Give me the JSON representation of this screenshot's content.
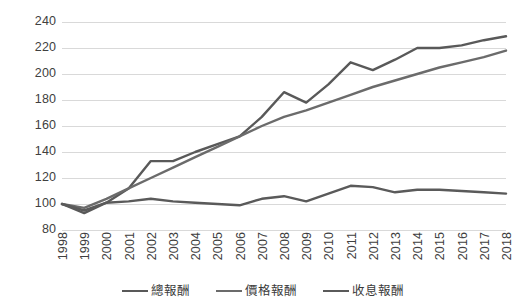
{
  "chart_data": {
    "type": "line",
    "title": "",
    "subtitle": "",
    "xlabel": "",
    "ylabel": "",
    "xlim": [
      1998,
      2018
    ],
    "ylim": [
      80,
      240
    ],
    "ytick_step": 20,
    "grid": true,
    "grid_axis": "y",
    "legend_position": "bottom",
    "categories": [
      "1998",
      "1999",
      "2000",
      "2001",
      "2002",
      "2003",
      "2004",
      "2005",
      "2006",
      "2007",
      "2008",
      "2009",
      "2010",
      "2011",
      "2012",
      "2013",
      "2014",
      "2015",
      "2016",
      "2017",
      "2018"
    ],
    "yticks": [
      80,
      100,
      120,
      140,
      160,
      180,
      200,
      220,
      240
    ],
    "ytick_labels": [
      "80",
      "100",
      "120",
      "140",
      "160",
      "180",
      "200",
      "220",
      "240"
    ],
    "series": [
      {
        "name": "總報酬",
        "color": "#595959",
        "width": 2.4,
        "values": [
          100,
          93,
          101,
          112,
          133,
          133,
          140,
          146,
          152,
          167,
          186,
          178,
          192,
          209,
          203,
          211,
          220,
          220,
          222,
          226,
          229
        ]
      },
      {
        "name": "價格報酬",
        "color": "#6b6b6b",
        "width": 2.4,
        "values": [
          100,
          97,
          104,
          112,
          120,
          128,
          136,
          144,
          152,
          160,
          167,
          172,
          178,
          184,
          190,
          195,
          200,
          205,
          209,
          213,
          218
        ]
      },
      {
        "name": "收息報酬",
        "color": "#5a5a5a",
        "width": 2.4,
        "values": [
          100,
          95,
          101,
          102,
          104,
          102,
          101,
          100,
          99,
          104,
          106,
          102,
          108,
          114,
          113,
          109,
          111,
          111,
          110,
          109,
          108
        ]
      }
    ],
    "legend": [
      {
        "label": "總報酬",
        "color": "#595959"
      },
      {
        "label": "價格報酬",
        "color": "#6b6b6b"
      },
      {
        "label": "收息報酬",
        "color": "#5a5a5a"
      }
    ],
    "style": {
      "gridline_color": "#d9d9d9",
      "axis_text_color": "#404040",
      "background": "#ffffff"
    }
  }
}
